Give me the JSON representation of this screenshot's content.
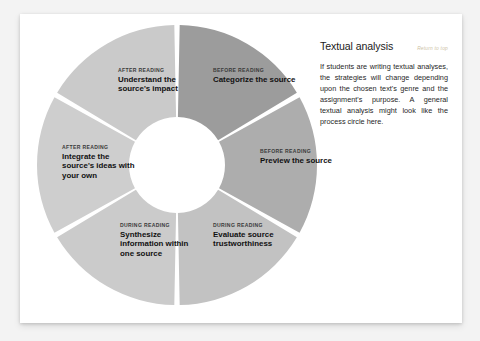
{
  "card": {
    "background_color": "#ffffff",
    "page_background_color": "#f3f3f3"
  },
  "diagram": {
    "name": "process-circle",
    "type": "donut",
    "center": {
      "x": 141,
      "y": 141
    },
    "outer_radius": 140,
    "inner_radius": 48,
    "gap_degrees": 2.2,
    "segments": [
      {
        "id": "categorize",
        "kicker": "BEFORE READING",
        "title": "Categorize the source",
        "color": "#9c9c9c",
        "start_angle": 0,
        "end_angle": 60
      },
      {
        "id": "preview",
        "kicker": "BEFORE READING",
        "title": "Preview the source",
        "color": "#adadad",
        "start_angle": 60,
        "end_angle": 120
      },
      {
        "id": "evaluate",
        "kicker": "DURING READING",
        "title": "Evaluate source trustworthiness",
        "color": "#c2c2c2",
        "start_angle": 120,
        "end_angle": 180
      },
      {
        "id": "synthesize",
        "kicker": "DURING READING",
        "title": "Synthesize information within one source",
        "color": "#cbcbcb",
        "start_angle": 180,
        "end_angle": 240
      },
      {
        "id": "integrate",
        "kicker": "AFTER READING",
        "title": "Integrate the source's ideas with your own",
        "color": "#cecece",
        "start_angle": 240,
        "end_angle": 300
      },
      {
        "id": "understand",
        "kicker": "AFTER READING",
        "title": "Understand the source's impact",
        "color": "#cacaca",
        "start_angle": 300,
        "end_angle": 360
      }
    ]
  },
  "panel": {
    "title": "Textual analysis",
    "return_link": "Return to top",
    "return_link_color": "#cdbfa6",
    "body": "If students are writing textual analyses, the strategies will change depending upon the chosen text's genre and the assignment's purpose. A general textual analysis might look like the process circle here."
  }
}
